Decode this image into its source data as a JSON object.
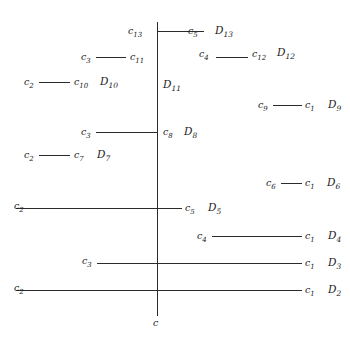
{
  "diagram": {
    "type": "hasse-style-lattice-line-diagram",
    "axis": {
      "label": "c",
      "x": 157,
      "top": 22,
      "bottom": 316
    },
    "rows": [
      {
        "id": "D13",
        "level_label": "D13",
        "left_label": "c13",
        "right_label": "c5",
        "y": 30,
        "x_start": 157,
        "x_end": 204,
        "has_segment": true,
        "left_label_x": 128,
        "right_label_x": 189,
        "d_label_x": 216
      },
      {
        "id": "D12",
        "level_label": "D12",
        "left_label": "c3",
        "right_label": "c4",
        "second_left_label": "c11",
        "second_right_label": "c12",
        "y": 56,
        "segments": [
          {
            "x1": 93,
            "x2": 129
          },
          {
            "x1": 215,
            "x2": 249
          }
        ],
        "labels": [
          {
            "text": "c3",
            "x": 80,
            "sub": "3"
          },
          {
            "text": "c11",
            "x": 131,
            "sub": "11"
          },
          {
            "text": "c4",
            "x": 199,
            "sub": "4"
          },
          {
            "text": "c12",
            "x": 251,
            "sub": "12"
          },
          {
            "text": "D12",
            "x": 276,
            "sub": "12",
            "is_d": true
          }
        ]
      },
      {
        "id": "D11",
        "level_label": "D11",
        "y": 83,
        "labels": [
          {
            "text": "D11",
            "x": 163,
            "sub": "11",
            "is_d": true
          }
        ]
      },
      {
        "id": "D10",
        "level_label": "D10",
        "y": 81,
        "segments": [
          {
            "x1": 37,
            "x2": 72
          }
        ],
        "labels": [
          {
            "text": "c2",
            "x": 24,
            "sub": "2"
          },
          {
            "text": "c10",
            "x": 74,
            "sub": "10"
          },
          {
            "text": "D10",
            "x": 99,
            "sub": "10",
            "is_d": true
          }
        ]
      },
      {
        "id": "D9",
        "level_label": "D9",
        "y": 104,
        "segments": [
          {
            "x1": 271,
            "x2": 303
          }
        ],
        "labels": [
          {
            "text": "c9",
            "x": 258,
            "sub": "9"
          },
          {
            "text": "c1",
            "x": 305,
            "sub": "1"
          },
          {
            "text": "D9",
            "x": 328,
            "sub": "9",
            "is_d": true
          }
        ]
      },
      {
        "id": "D8",
        "level_label": "D8",
        "y": 131,
        "segments": [
          {
            "x1": 93,
            "x2": 157
          }
        ],
        "labels": [
          {
            "text": "c3",
            "x": 80,
            "sub": "3"
          },
          {
            "text": "c8",
            "x": 163,
            "sub": "8"
          },
          {
            "text": "D8",
            "x": 183,
            "sub": "8",
            "is_d": true
          }
        ]
      },
      {
        "id": "D7",
        "level_label": "D7",
        "y": 154,
        "segments": [
          {
            "x1": 37,
            "x2": 72
          }
        ],
        "labels": [
          {
            "text": "c2",
            "x": 24,
            "sub": "2"
          },
          {
            "text": "c7",
            "x": 74,
            "sub": "7"
          },
          {
            "text": "D7",
            "x": 97,
            "sub": "7",
            "is_d": true
          }
        ]
      },
      {
        "id": "D6",
        "level_label": "D6",
        "y": 182,
        "segments": [
          {
            "x1": 279,
            "x2": 302
          }
        ],
        "labels": [
          {
            "text": "c6",
            "x": 266,
            "sub": "6"
          },
          {
            "text": "c1",
            "x": 304,
            "sub": "1"
          },
          {
            "text": "D6",
            "x": 326,
            "sub": "6",
            "is_d": true
          }
        ]
      },
      {
        "id": "D5",
        "level_label": "D5",
        "y": 207,
        "segments": [
          {
            "x1": 16,
            "x2": 198
          }
        ],
        "labels": [
          {
            "text": "c2",
            "x": 14,
            "sub": "2"
          },
          {
            "text": "c5",
            "x": 185,
            "sub": "5"
          },
          {
            "text": "D5",
            "x": 208,
            "sub": "5",
            "is_d": true
          }
        ]
      },
      {
        "id": "D4",
        "level_label": "D4",
        "y": 235,
        "segments": [
          {
            "x1": 210,
            "x2": 303
          }
        ],
        "labels": [
          {
            "text": "c4",
            "x": 197,
            "sub": "4"
          },
          {
            "text": "c1",
            "x": 305,
            "sub": "1"
          },
          {
            "text": "D4",
            "x": 328,
            "sub": "4",
            "is_d": true
          }
        ]
      },
      {
        "id": "D3",
        "level_label": "D3",
        "y": 262,
        "segments": [
          {
            "x1": 95,
            "x2": 303
          }
        ],
        "labels": [
          {
            "text": "c3",
            "x": 82,
            "sub": "3"
          },
          {
            "text": "c1",
            "x": 305,
            "sub": "1"
          },
          {
            "text": "D3",
            "x": 328,
            "sub": "3",
            "is_d": true
          }
        ]
      },
      {
        "id": "D2",
        "level_label": "D2",
        "y": 289,
        "segments": [
          {
            "x1": 16,
            "x2": 303
          }
        ],
        "labels": [
          {
            "text": "c2",
            "x": 14,
            "sub": "2"
          },
          {
            "text": "c1",
            "x": 305,
            "sub": "1"
          },
          {
            "text": "D2",
            "x": 328,
            "sub": "2",
            "is_d": true
          }
        ]
      }
    ]
  },
  "labels": {
    "c13": "c",
    "c13_sub": "13",
    "c12": "c",
    "c12_sub": "12",
    "c11": "c",
    "c11_sub": "11",
    "c10": "c",
    "c10_sub": "10",
    "c9": "c",
    "c9_sub": "9",
    "c8": "c",
    "c8_sub": "8",
    "c7": "c",
    "c7_sub": "7",
    "c6": "c",
    "c6_sub": "6",
    "c5": "c",
    "c5_sub": "5",
    "c4": "c",
    "c4_sub": "4",
    "c3": "c",
    "c3_sub": "3",
    "c2": "c",
    "c2_sub": "2",
    "c1": "c",
    "c1_sub": "1",
    "c": "c",
    "D13": "D",
    "D13_sub": "13",
    "D12": "D",
    "D12_sub": "12",
    "D11": "D",
    "D11_sub": "11",
    "D10": "D",
    "D10_sub": "10",
    "D9": "D",
    "D9_sub": "9",
    "D8": "D",
    "D8_sub": "8",
    "D7": "D",
    "D7_sub": "7",
    "D6": "D",
    "D6_sub": "6",
    "D5": "D",
    "D5_sub": "5",
    "D4": "D",
    "D4_sub": "4",
    "D3": "D",
    "D3_sub": "3",
    "D2": "D",
    "D2_sub": "2"
  }
}
